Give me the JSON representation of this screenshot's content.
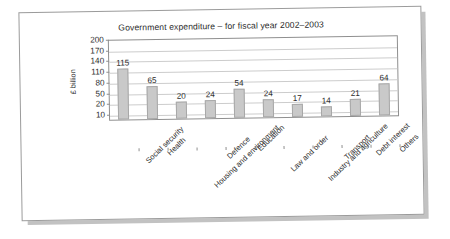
{
  "chart_data": {
    "type": "bar",
    "title": "Government expenditure – for fiscal year 2002–2003",
    "xlabel": "",
    "ylabel": "£ billion",
    "categories": [
      "Social security",
      "Health",
      "Housing and environment",
      "Defence",
      "Education",
      "Law and order",
      "Industry and agriculture",
      "Transport",
      "Debt interest",
      "Others"
    ],
    "values": [
      115,
      65,
      20,
      24,
      54,
      24,
      17,
      14,
      21,
      64
    ],
    "ytick_labels": [
      "200",
      "170",
      "140",
      "110",
      "80",
      "50",
      "20",
      "10"
    ],
    "ytick_values": [
      200,
      170,
      140,
      110,
      80,
      50,
      20,
      10
    ],
    "ylim": [
      10,
      200
    ],
    "grid": true,
    "legend": "none",
    "bar_color": "#c9c9c9",
    "bar_border_color": "#a8a8a8",
    "axis_color": "#8f8f8f",
    "grid_color": "#cccccc",
    "text_color": "#2b2b2b"
  }
}
